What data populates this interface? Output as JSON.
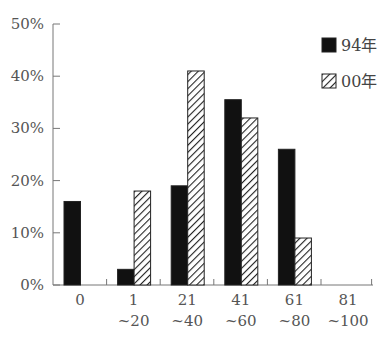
{
  "chart_data": {
    "type": "bar",
    "title": "",
    "xlabel": "",
    "ylabel": "",
    "categories": [
      "0",
      "1~20",
      "21~40",
      "41~60",
      "61~80",
      "81~100"
    ],
    "category_lines": [
      [
        "0",
        ""
      ],
      [
        "1",
        "~20"
      ],
      [
        "21",
        "~40"
      ],
      [
        "41",
        "~60"
      ],
      [
        "61",
        "~80"
      ],
      [
        "81",
        "~100"
      ]
    ],
    "series": [
      {
        "name": "94年",
        "pattern": "solid",
        "color": "#111111",
        "values": [
          16,
          3,
          19,
          35.5,
          26,
          0
        ]
      },
      {
        "name": "00年",
        "pattern": "hatch",
        "color": "#222222",
        "values": [
          0,
          18,
          41,
          32,
          9,
          0
        ]
      }
    ],
    "yticks": [
      "0%",
      "10%",
      "20%",
      "30%",
      "40%",
      "50%"
    ],
    "ylim": [
      0,
      50
    ],
    "grid": false,
    "legend_position": "top-right"
  }
}
